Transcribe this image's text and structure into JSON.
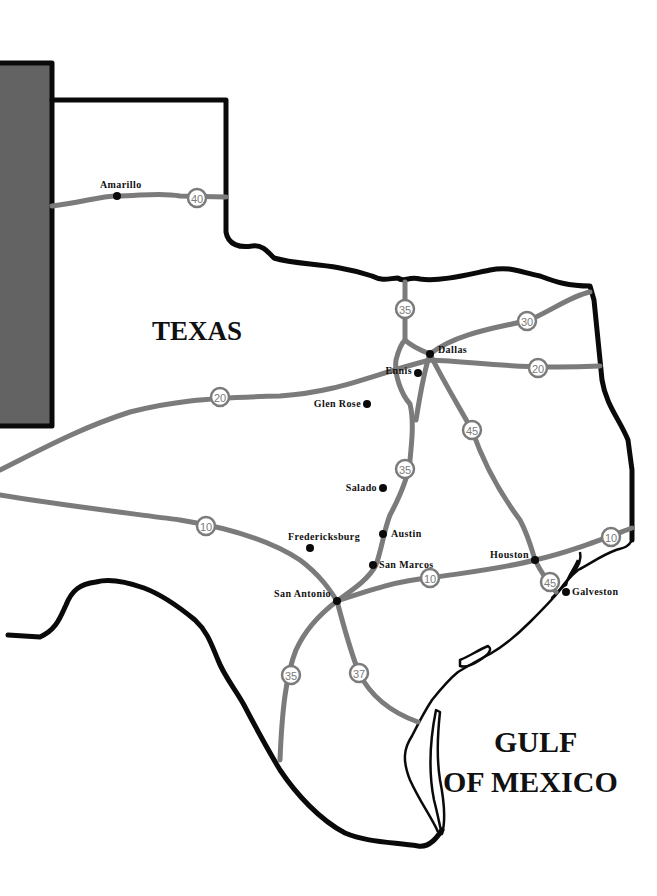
{
  "map": {
    "region_label": "TEXAS",
    "water_label_line1": "GULF",
    "water_label_line2": "OF MEXICO",
    "colors": {
      "border": "#0a0a0a",
      "road": "#7b7b7b",
      "panel": "#636363",
      "background": "#ffffff"
    },
    "cities": [
      {
        "name": "Amarillo",
        "x": 117,
        "y": 196
      },
      {
        "name": "Dallas",
        "x": 430,
        "y": 354
      },
      {
        "name": "Ennis",
        "x": 418,
        "y": 373
      },
      {
        "name": "Glen Rose",
        "x": 367,
        "y": 404
      },
      {
        "name": "Salado",
        "x": 383,
        "y": 488
      },
      {
        "name": "Austin",
        "x": 383,
        "y": 534
      },
      {
        "name": "Fredericksburg",
        "x": 310,
        "y": 548
      },
      {
        "name": "San Marcos",
        "x": 373,
        "y": 565
      },
      {
        "name": "San Antonio",
        "x": 337,
        "y": 601
      },
      {
        "name": "Houston",
        "x": 535,
        "y": 560
      },
      {
        "name": "Galveston",
        "x": 566,
        "y": 592
      }
    ],
    "highway_shields": [
      {
        "number": "40",
        "x": 197,
        "y": 198
      },
      {
        "number": "35",
        "x": 405,
        "y": 309
      },
      {
        "number": "30",
        "x": 527,
        "y": 321
      },
      {
        "number": "20",
        "x": 538,
        "y": 368
      },
      {
        "number": "20",
        "x": 220,
        "y": 397
      },
      {
        "number": "45",
        "x": 472,
        "y": 430
      },
      {
        "number": "35",
        "x": 405,
        "y": 469
      },
      {
        "number": "10",
        "x": 206,
        "y": 526
      },
      {
        "number": "10",
        "x": 611,
        "y": 537
      },
      {
        "number": "10",
        "x": 430,
        "y": 578
      },
      {
        "number": "45",
        "x": 550,
        "y": 582
      },
      {
        "number": "35",
        "x": 291,
        "y": 675
      },
      {
        "number": "37",
        "x": 359,
        "y": 673
      }
    ]
  }
}
